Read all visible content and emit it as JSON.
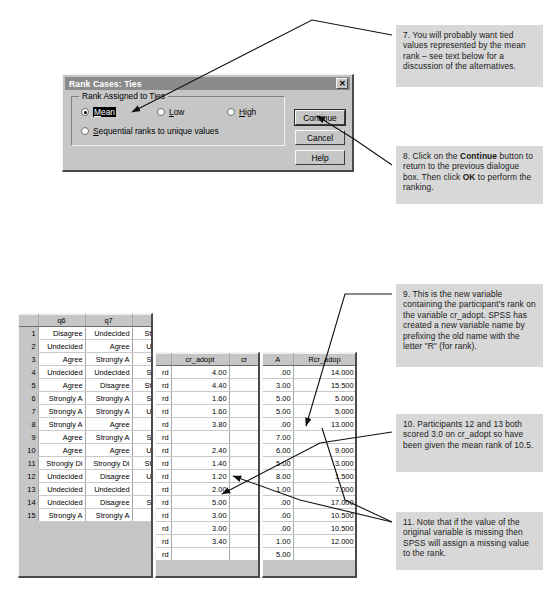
{
  "dialog": {
    "title": "Rank Cases: Ties",
    "close_label": "✕",
    "group_label": "Rank Assigned to Ties",
    "options": [
      {
        "label": "Mean",
        "accel": "M",
        "selected": true
      },
      {
        "label": "Low",
        "accel": "L",
        "selected": false
      },
      {
        "label": "High",
        "accel": "H",
        "selected": false
      },
      {
        "label": "Sequential ranks to unique values",
        "accel": "S",
        "selected": false
      }
    ],
    "buttons": [
      {
        "label": "Continue",
        "default": true
      },
      {
        "label": "Cancel",
        "default": false
      },
      {
        "label": "Help",
        "default": false
      }
    ]
  },
  "spss": {
    "title": "adoptionstudy.sav - SPSS Data Edit",
    "menus": [
      "File",
      "Edit",
      "View",
      "Data",
      "Transform",
      "Anal"
    ],
    "cell_reference": "20 : num_SA",
    "cell_value": "1",
    "left_pane": {
      "columns": [
        "",
        "q6",
        "q7",
        ""
      ],
      "rows": [
        {
          "n": "1",
          "q6": "Disagree",
          "q7": "Undecided",
          "c4": "St"
        },
        {
          "n": "2",
          "q6": "Undecided",
          "q7": "Agree",
          "c4": "U"
        },
        {
          "n": "3",
          "q6": "Agree",
          "q7": "Strongly A",
          "c4": "S"
        },
        {
          "n": "4",
          "q6": "Undecided",
          "q7": "Undecided",
          "c4": "S"
        },
        {
          "n": "5",
          "q6": "Agree",
          "q7": "Disagree",
          "c4": "St"
        },
        {
          "n": "6",
          "q6": "Strongly A",
          "q7": "Strongly A",
          "c4": "S"
        },
        {
          "n": "7",
          "q6": "Strongly A",
          "q7": "Strongly A",
          "c4": "U"
        },
        {
          "n": "8",
          "q6": "Strongly A",
          "q7": "Agree",
          "c4": ""
        },
        {
          "n": "9",
          "q6": "Agree",
          "q7": "Strongly A",
          "c4": "S"
        },
        {
          "n": "10",
          "q6": "Agree",
          "q7": "Agree",
          "c4": "U"
        },
        {
          "n": "11",
          "q6": "Strongly Di",
          "q7": "Strongly Di",
          "c4": "St"
        },
        {
          "n": "12",
          "q6": "Undecided",
          "q7": "Disagree",
          "c4": "U"
        },
        {
          "n": "13",
          "q6": "Undecided",
          "q7": "Undecided",
          "c4": ""
        },
        {
          "n": "14",
          "q6": "Undecided",
          "q7": "Disagree",
          "c4": "S"
        },
        {
          "n": "15",
          "q6": "Strongly A",
          "q7": "Strongly A",
          "c4": ""
        }
      ]
    },
    "mid_pane": {
      "columns": [
        "",
        "cr_adopt",
        "cr"
      ],
      "rows": [
        {
          "c0": "rd",
          "cr_adopt": "4.00"
        },
        {
          "c0": "rd",
          "cr_adopt": "4.40"
        },
        {
          "c0": "rd",
          "cr_adopt": "1.60"
        },
        {
          "c0": "rd",
          "cr_adopt": "1.60"
        },
        {
          "c0": "rd",
          "cr_adopt": "3.80"
        },
        {
          "c0": "rd",
          "cr_adopt": ""
        },
        {
          "c0": "rd",
          "cr_adopt": "2.40"
        },
        {
          "c0": "rd",
          "cr_adopt": "1.40"
        },
        {
          "c0": "rd",
          "cr_adopt": "1.20"
        },
        {
          "c0": "rd",
          "cr_adopt": "2.00"
        },
        {
          "c0": "rd",
          "cr_adopt": "5.00"
        },
        {
          "c0": "rd",
          "cr_adopt": "3.00"
        },
        {
          "c0": "rd",
          "cr_adopt": "3.00"
        },
        {
          "c0": "rd",
          "cr_adopt": "3.40"
        },
        {
          "c0": "rd",
          "cr_adopt": ""
        }
      ]
    },
    "right_pane": {
      "columns": [
        "A",
        "Rcr_adop"
      ],
      "rows": [
        {
          "a": ".00",
          "rcr": "14.000"
        },
        {
          "a": "3.00",
          "rcr": "15.500"
        },
        {
          "a": "5.00",
          "rcr": "5.000"
        },
        {
          "a": "5.00",
          "rcr": "5.000"
        },
        {
          "a": ".00",
          "rcr": "13.000"
        },
        {
          "a": "7.00",
          "rcr": ""
        },
        {
          "a": "6.00",
          "rcr": "9.000"
        },
        {
          "a": "5.00",
          "rcr": "3.000"
        },
        {
          "a": "8.00",
          "rcr": "1.500"
        },
        {
          "a": "1.00",
          "rcr": "7.000"
        },
        {
          "a": ".00",
          "rcr": "17.000"
        },
        {
          "a": ".00",
          "rcr": "10.500"
        },
        {
          "a": ".00",
          "rcr": "10.500"
        },
        {
          "a": "1.00",
          "rcr": "12.000"
        },
        {
          "a": "5.00",
          "rcr": ""
        }
      ]
    }
  },
  "notes": {
    "n7": "7. You will probably want tied values represented by the mean rank – see text below for a discussion of the alternatives.",
    "n8_part1": "8. Click on the ",
    "n8_bold1": "Continue",
    "n8_part2": " button to return to the previous dialogue box. Then click ",
    "n8_bold2": "OK",
    "n8_part3": " to perform the ranking.",
    "n9": "9. This is the new variable containing the participant's rank on the variable cr_adopt. SPSS has created a new variable name by prefixing the old name with the letter \"R\" (for rank).",
    "n10": "10. Participants 12 and 13 both scored 3.0 on cr_adopt so have been given the mean rank of 10.5.",
    "n11": "11. Note that if the value of the original variable is missing then SPSS will assign a missing value to the rank."
  }
}
